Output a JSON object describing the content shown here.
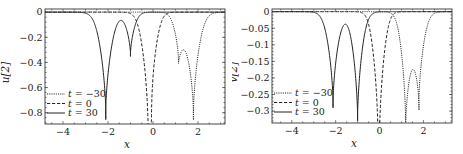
{
  "chart_data": [
    {
      "type": "line",
      "panel": "left",
      "title": "",
      "xlabel": "x",
      "ylabel": "u[2]",
      "xlim": [
        -4.8,
        3.2
      ],
      "ylim": [
        -0.89,
        0.025
      ],
      "xticks": [
        -4,
        -2,
        0,
        2
      ],
      "xtick_labels": [
        "−4",
        "−2",
        "0",
        "2"
      ],
      "yticks": [
        0,
        -0.2,
        -0.4,
        -0.6,
        -0.8
      ],
      "ytick_labels": [
        "0",
        "−0.2",
        "−0.4",
        "−0.6",
        "−0.8"
      ],
      "grid": false,
      "legend_position": "lower left",
      "series": [
        {
          "name": "t = −30",
          "style": "dotted",
          "loops": [
            {
              "center": 1.12,
              "depth": -0.37,
              "width": 0.22,
              "loop_half_width": 0.07
            },
            {
              "center": 1.8,
              "depth": -0.855,
              "width": 0.3,
              "loop_half_width": 0.1
            }
          ],
          "hump": {
            "x": 1.42,
            "value": -0.075
          }
        },
        {
          "name": "t = 0",
          "style": "dashed",
          "loops": [
            {
              "center": -0.27,
              "depth": -0.82,
              "width": 0.26,
              "loop_half_width": 0.09
            },
            {
              "center": 0.02,
              "depth": -0.555,
              "width": 0.22,
              "loop_half_width": 0.08
            }
          ],
          "hump": {
            "x": -0.12,
            "value": -0.19
          }
        },
        {
          "name": "t = 30",
          "style": "solid",
          "loops": [
            {
              "center": -2.1,
              "depth": -0.855,
              "width": 0.3,
              "loop_half_width": 0.1
            },
            {
              "center": -1.0,
              "depth": -0.35,
              "width": 0.22,
              "loop_half_width": 0.07
            }
          ],
          "hump": {
            "x": -1.45,
            "value": -0.025
          }
        }
      ]
    },
    {
      "type": "line",
      "panel": "right",
      "title": "",
      "xlabel": "x",
      "ylabel": "v[2]",
      "xlim": [
        -4.9,
        3.3
      ],
      "ylim": [
        -0.336,
        0.008
      ],
      "xticks": [
        -4,
        -2,
        0,
        2
      ],
      "xtick_labels": [
        "−4",
        "−2",
        "0",
        "2"
      ],
      "yticks": [
        0,
        -0.05,
        -0.1,
        -0.15,
        -0.2,
        -0.25,
        -0.3
      ],
      "ytick_labels": [
        "0",
        "−0.05",
        "−0.1",
        "−0.15",
        "−0.2",
        "−0.25",
        "−0.3"
      ],
      "grid": false,
      "legend_position": "lower left",
      "series": [
        {
          "name": "t = −30",
          "style": "dotted",
          "loops": [
            {
              "center": 1.18,
              "depth": -0.325,
              "width": 0.24,
              "loop_half_width": 0.07
            },
            {
              "center": 1.8,
              "depth": -0.29,
              "width": 0.26,
              "loop_half_width": 0.09
            }
          ],
          "hump": {
            "x": 1.47,
            "value": -0.035
          }
        },
        {
          "name": "t = 0",
          "style": "dashed",
          "loops": [
            {
              "center": -0.15,
              "depth": -0.29,
              "width": 0.22,
              "loop_half_width": 0.08
            },
            {
              "center": 0.07,
              "depth": -0.31,
              "width": 0.22,
              "loop_half_width": 0.08
            }
          ],
          "hump": {
            "x": -0.04,
            "value": -0.1
          }
        },
        {
          "name": "t = 30",
          "style": "solid",
          "loops": [
            {
              "center": -2.12,
              "depth": -0.29,
              "width": 0.28,
              "loop_half_width": 0.09
            },
            {
              "center": -1.0,
              "depth": -0.33,
              "width": 0.26,
              "loop_half_width": 0.08
            }
          ],
          "hump": {
            "x": -1.55,
            "value": -0.012
          }
        }
      ]
    }
  ],
  "panels": [
    {
      "name": "left",
      "frame": {
        "x0": 45,
        "y0": 9,
        "x1": 225,
        "y1": 124
      },
      "ylabel": "u[2]",
      "xlabel": "x",
      "legend": [
        {
          "style": "dotted",
          "prefix": "t",
          "text": " = −30"
        },
        {
          "style": "dashed",
          "prefix": "t",
          "text": " = 0"
        },
        {
          "style": "solid",
          "prefix": "t",
          "text": " = 30"
        }
      ]
    },
    {
      "name": "right",
      "frame": {
        "x0": 272,
        "y0": 9,
        "x1": 452,
        "y1": 123
      },
      "ylabel": "v[2]",
      "xlabel": "x",
      "legend": [
        {
          "style": "dotted",
          "prefix": "t",
          "text": " = −30"
        },
        {
          "style": "dashed",
          "prefix": "t",
          "text": " = 0"
        },
        {
          "style": "solid",
          "prefix": "t",
          "text": " = 30"
        }
      ]
    }
  ],
  "colors": {
    "line": "#222222",
    "frame": "#333333",
    "background": "#ffffff"
  }
}
